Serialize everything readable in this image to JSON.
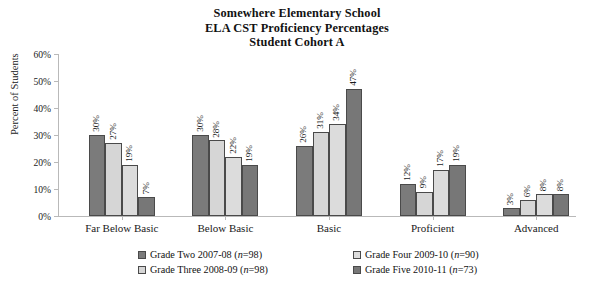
{
  "title": {
    "line1": "Somewhere Elementary School",
    "line2": "ELA CST Proficiency Percentages",
    "line3": "Student Cohort A"
  },
  "axes": {
    "ylabel": "Percent of Students",
    "xlabel": "",
    "yticks": [
      "0%",
      "10%",
      "20%",
      "30%",
      "40%",
      "50%",
      "60%"
    ]
  },
  "legend": {
    "items": [
      {
        "label": "Grade Two 2007-08 (n=98)",
        "name": "Grade Two 2007-08",
        "n": "98",
        "swatch": "#7b7b7b"
      },
      {
        "label": "Grade Three 2008-09 (n=98)",
        "name": "Grade Three 2008-09",
        "n": "98",
        "swatch": "#d6d6d6"
      },
      {
        "label": "Grade Four 2009-10 (n=90)",
        "name": "Grade Four 2009-10",
        "n": "90",
        "swatch": "#dcdcdc"
      },
      {
        "label": "Grade Five 2010-11 (n=73)",
        "name": "Grade Five 2010-11",
        "n": "73",
        "swatch": "#777777"
      }
    ]
  },
  "chart_data": {
    "type": "bar",
    "title": "Somewhere Elementary School ELA CST Proficiency Percentages Student Cohort A",
    "xlabel": "",
    "ylabel": "Percent of Students",
    "ylim": [
      0,
      60
    ],
    "ytick_step": 10,
    "grid": false,
    "legend_position": "bottom",
    "value_suffix": "%",
    "categories": [
      "Far Below Basic",
      "Below Basic",
      "Basic",
      "Proficient",
      "Advanced"
    ],
    "series": [
      {
        "name": "Grade Two 2007-08 (n=98)",
        "color": "#7b7b7b",
        "values": [
          30,
          30,
          26,
          12,
          3
        ],
        "labels": [
          "30%",
          "30%",
          "26%",
          "12%",
          "3%"
        ]
      },
      {
        "name": "Grade Three 2008-09 (n=98)",
        "color": "#d6d6d6",
        "values": [
          27,
          28,
          31,
          9,
          6
        ],
        "labels": [
          "27%",
          "28%",
          "31%",
          "9%",
          "6%"
        ]
      },
      {
        "name": "Grade Four 2009-10 (n=90)",
        "color": "#dcdcdc",
        "values": [
          19,
          22,
          34,
          17,
          8
        ],
        "labels": [
          "19%",
          "22%",
          "34%",
          "17%",
          "8%"
        ]
      },
      {
        "name": "Grade Five 2010-11 (n=73)",
        "color": "#777777",
        "values": [
          7,
          19,
          47,
          19,
          8
        ],
        "labels": [
          "7%",
          "19%",
          "47%",
          "19%",
          "8%"
        ]
      }
    ]
  }
}
